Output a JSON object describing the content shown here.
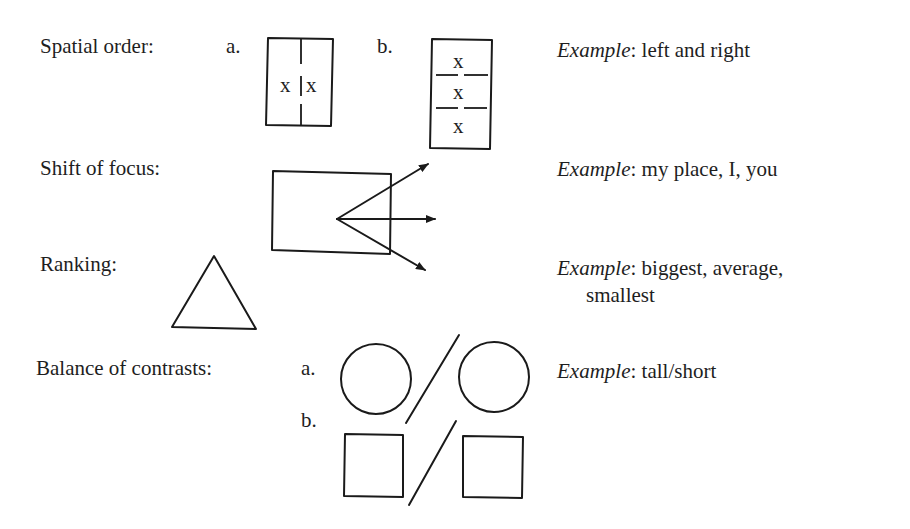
{
  "rows": [
    {
      "id": "spatial-order",
      "label": "Spatial order:",
      "variants": [
        "a.",
        "b."
      ],
      "marks": {
        "a": [
          "x",
          "x"
        ],
        "b": [
          "x",
          "x",
          "x"
        ]
      },
      "example_prefix": "Example",
      "example_text": ": left and right"
    },
    {
      "id": "shift-of-focus",
      "label": "Shift of focus:",
      "example_prefix": "Example",
      "example_text": ": my place, I, you"
    },
    {
      "id": "ranking",
      "label": "Ranking:",
      "example_prefix": "Example",
      "example_text": ": biggest, average,",
      "example_text_line2": "smallest"
    },
    {
      "id": "balance-of-contrasts",
      "label": "Balance of contrasts:",
      "variants": [
        "a.",
        "b."
      ],
      "example_prefix": "Example",
      "example_text": ": tall/short"
    }
  ]
}
